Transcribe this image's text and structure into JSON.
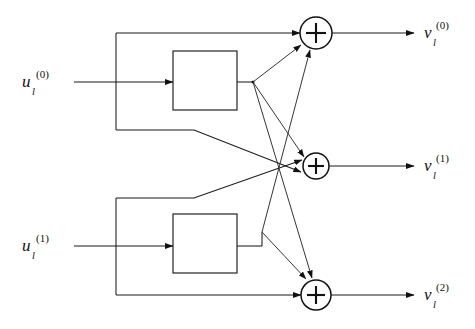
{
  "diagram": {
    "type": "signal-flow-block-diagram",
    "canvas": {
      "width": 475,
      "height": 329
    },
    "colors": {
      "background": "#ffffff",
      "line": "#1a1a1a",
      "text": "#111111"
    },
    "inputs": [
      {
        "id": "u0",
        "base": "u",
        "subscript": "l",
        "superscript": "(0)",
        "label_x": 22,
        "label_y": 82,
        "arrow_from_x": 74,
        "arrow_to_x": 173,
        "y": 82
      },
      {
        "id": "u1",
        "base": "u",
        "subscript": "l",
        "superscript": "(1)",
        "label_x": 22,
        "label_y": 246,
        "arrow_from_x": 74,
        "arrow_to_x": 173,
        "y": 246
      }
    ],
    "outputs": [
      {
        "id": "v0",
        "base": "v",
        "subscript": "l",
        "superscript": "(0)",
        "label_x": 424,
        "label_y": 33,
        "arrow_from_x": 332,
        "arrow_to_x": 414,
        "y": 33
      },
      {
        "id": "v1",
        "base": "v",
        "subscript": "l",
        "superscript": "(1)",
        "label_x": 424,
        "label_y": 166,
        "arrow_from_x": 329,
        "arrow_to_x": 414,
        "y": 166
      },
      {
        "id": "v2",
        "base": "v",
        "subscript": "l",
        "superscript": "(2)",
        "label_x": 424,
        "label_y": 295,
        "arrow_from_x": 331,
        "arrow_to_x": 414,
        "y": 295
      }
    ],
    "blocks": [
      {
        "id": "block-upper",
        "x": 173,
        "y": 51,
        "width": 64,
        "height": 59,
        "label": ""
      },
      {
        "id": "block-lower",
        "x": 173,
        "y": 214,
        "width": 64,
        "height": 59,
        "label": ""
      }
    ],
    "adders": [
      {
        "id": "adder-0",
        "cx": 316,
        "cy": 33,
        "r": 16,
        "symbol": "+",
        "output": "v0"
      },
      {
        "id": "adder-1",
        "cx": 316,
        "cy": 166,
        "r": 13,
        "symbol": "+",
        "output": "v1"
      },
      {
        "id": "adder-2",
        "cx": 316,
        "cy": 295,
        "r": 15,
        "symbol": "+",
        "output": "v2"
      }
    ],
    "junctions": [
      {
        "id": "fanout-upper",
        "x": 253,
        "y": 82
      },
      {
        "id": "fanout-lower",
        "x": 253,
        "y": 246
      }
    ],
    "bypass_rails": [
      {
        "id": "rail-upper-top",
        "path": "M116,33 L300,33",
        "description": "upper input bypass to adder 0"
      },
      {
        "id": "rail-upper-bottom",
        "path": "M116,33 L116,130 L194,130 L301,172",
        "description": "upper input bypass to adder 1"
      },
      {
        "id": "rail-lower-top",
        "path": "M116,198 L194,198 L302,160",
        "description": "lower input bypass to adder 1"
      },
      {
        "id": "rail-lower-bottom",
        "path": "M116,198 L116,295 L301,295",
        "description": "lower input bypass to adder 2"
      }
    ],
    "fanout_edges": [
      {
        "from": "fanout-upper",
        "to": "adder-0",
        "path": "M253,82 L302,44"
      },
      {
        "from": "fanout-upper",
        "to": "adder-1",
        "path": "M253,82 L303,160"
      },
      {
        "from": "fanout-upper",
        "to": "adder-2",
        "path": "M253,82 L311,281"
      },
      {
        "from": "fanout-lower",
        "to": "adder-0",
        "path": "M253,246 L309,49"
      },
      {
        "from": "fanout-lower",
        "to": "adder-2",
        "path": "M253,246 L305,282"
      }
    ]
  }
}
